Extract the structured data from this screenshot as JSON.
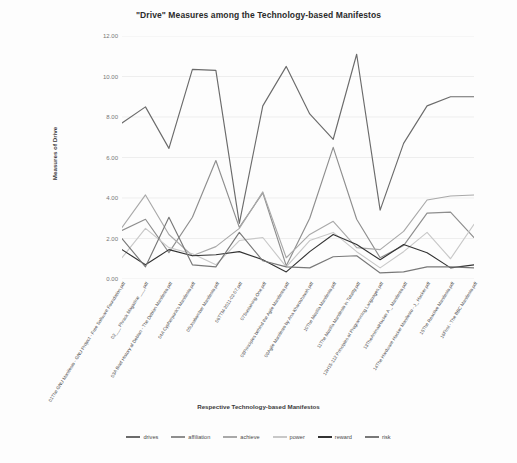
{
  "chart_data": {
    "type": "line",
    "title": "\"Drive\" Measures among the Technology-based Manifestos",
    "xlabel": "Respective Technology-based Manifestos",
    "ylabel": "Measures of Drive",
    "ylim": [
      0,
      12
    ],
    "ytick_labels": [
      "0.00",
      "2.00",
      "4.00",
      "6.00",
      "8.00",
      "10.00",
      "12.00"
    ],
    "yticks": [
      0,
      2,
      4,
      6,
      8,
      10,
      12
    ],
    "grid": true,
    "legend_position": "bottom",
    "categories": [
      "01The GNU Manifesto - GNU Project - Free Software Foundation.pdf",
      "02___ Phrack Magazine ___.pdf",
      "03A Brief History of Debian - The Debian Manifesto.pdf",
      "04A Cypherpunk's Manifesto.pdf",
      "05Unabomber Manifesto.pdf",
      "06TTM-2011-02-07.pdf",
      "07Sustaining-One.pdf",
      "08Principles behind the Agile Manifesto.pdf",
      "09Agile Manifesto by Ana Khoroshavah.pdf",
      "10The Mozilla Manifesto.pdf",
      "11The Mozilla Manifesto in Totality.pdf",
      "12H15-112 Principles of Programming Languages.pdf",
      "13TheAnimatHacker A _ Manifesto.pdf",
      "14The Hardware Hacker Manifesto - J_ Hacker.pdf",
      "15The Reactive Manifesto.pdf",
      "16First - The BBC Manifesto.pdf"
    ],
    "series": [
      {
        "name": "drives",
        "color": "#6b6b6b",
        "values": [
          7.7,
          8.5,
          6.45,
          10.35,
          10.3,
          2.75,
          8.55,
          10.5,
          8.15,
          6.9,
          11.1,
          3.4,
          6.7,
          8.55,
          9.0,
          9.0
        ]
      },
      {
        "name": "affiliation",
        "color": "#8e8e8e",
        "values": [
          2.4,
          2.95,
          1.3,
          3.05,
          5.85,
          2.55,
          4.25,
          0.65,
          3.0,
          6.5,
          2.95,
          1.05,
          1.65,
          3.25,
          3.3,
          2.05
        ]
      },
      {
        "name": "achieve",
        "color": "#a9a9a9",
        "values": [
          2.55,
          4.15,
          2.2,
          1.15,
          1.6,
          2.5,
          4.3,
          1.05,
          2.2,
          2.85,
          1.55,
          1.45,
          2.35,
          3.9,
          4.1,
          4.15
        ]
      },
      {
        "name": "power",
        "color": "#c8c8c8",
        "values": [
          1.05,
          2.5,
          1.55,
          1.25,
          0.7,
          1.9,
          2.05,
          0.6,
          1.9,
          2.3,
          1.35,
          0.55,
          1.35,
          2.3,
          1.0,
          2.7
        ]
      },
      {
        "name": "reward",
        "color": "#333333",
        "values": [
          1.45,
          0.7,
          1.45,
          1.15,
          1.2,
          1.35,
          0.95,
          0.35,
          1.35,
          2.2,
          1.7,
          0.95,
          1.7,
          1.3,
          0.55,
          0.7
        ]
      },
      {
        "name": "risk",
        "color": "#787878",
        "values": [
          2.0,
          0.6,
          3.05,
          0.7,
          0.6,
          2.3,
          0.9,
          0.6,
          0.55,
          1.1,
          1.15,
          0.3,
          0.35,
          0.6,
          0.6,
          0.55
        ]
      }
    ]
  }
}
